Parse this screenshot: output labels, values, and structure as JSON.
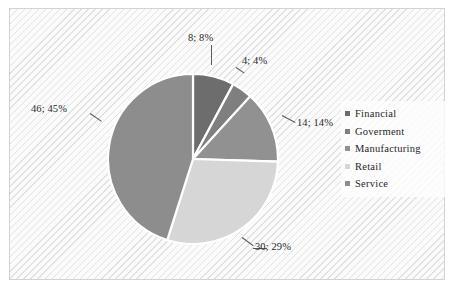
{
  "chart_data": {
    "type": "pie",
    "title": "",
    "subtitle": "",
    "xlabel": "",
    "ylabel": "",
    "grid": false,
    "legend_position": "right",
    "total": 102,
    "start_angle_deg": 0,
    "direction": "clockwise",
    "categories": [
      "Financial",
      "Goverment",
      "Manufacturing",
      "Retail",
      "Service"
    ],
    "values": [
      8,
      4,
      14,
      30,
      46
    ],
    "percents": [
      8,
      4,
      14,
      29,
      45
    ],
    "data_labels": [
      "8; 8%",
      "4; 4%",
      "14; 14%",
      "30; 29%",
      "46; 45%"
    ],
    "colors": [
      "#6d6d6d",
      "#7f7f7f",
      "#919191",
      "#d6d6d6",
      "#8d8d8d"
    ],
    "slices": [
      {
        "name": "Financial",
        "value": 8,
        "percent": 8,
        "label": "8; 8%",
        "color": "#6d6d6d"
      },
      {
        "name": "Goverment",
        "value": 4,
        "percent": 4,
        "label": "4; 4%",
        "color": "#7f7f7f"
      },
      {
        "name": "Manufacturing",
        "value": 14,
        "percent": 14,
        "label": "14; 14%",
        "color": "#919191"
      },
      {
        "name": "Retail",
        "value": 30,
        "percent": 29,
        "label": "30; 29%",
        "color": "#d6d6d6"
      },
      {
        "name": "Service",
        "value": 46,
        "percent": 45,
        "label": "46; 45%",
        "color": "#8d8d8d"
      }
    ]
  },
  "legend": {
    "items": [
      {
        "label": "Financial",
        "color": "#6d6d6d"
      },
      {
        "label": "Goverment",
        "color": "#7f7f7f"
      },
      {
        "label": "Manufacturing",
        "color": "#919191"
      },
      {
        "label": "Retail",
        "color": "#d6d6d6"
      },
      {
        "label": "Service",
        "color": "#8d8d8d"
      }
    ]
  },
  "style": {
    "plot_background": "#fbfbfb",
    "plot_border": "#d3d3d3",
    "slice_outline": "#ffffff",
    "label_color": "#2b2b2b",
    "page_background": "#ffffff"
  }
}
